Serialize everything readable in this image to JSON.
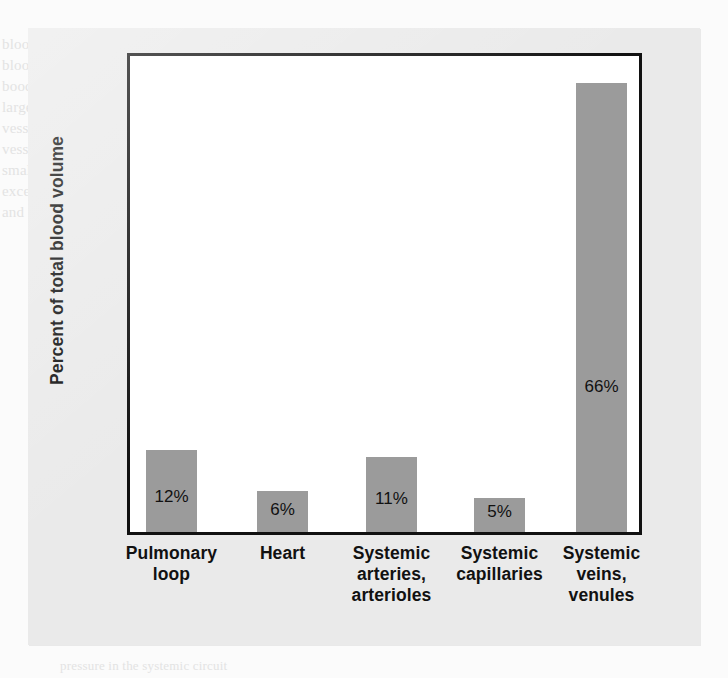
{
  "figure": {
    "background_color": "#eaeaea",
    "plot_background_color": "#ffffff",
    "frame_color": "#111111",
    "bar_color": "#9b9b9b"
  },
  "bleed_text": {
    "left": "blood\nblood v\nbood p\nlarge b\nvessel\nvessel\nsmall b\nexceed\nand re",
    "right": "arteries\nterminal\nno to c\nor cha\nonly tw\n\nas the\nnd the\nhich is\nitates",
    "bottom": "pressure in the systemic circuit"
  },
  "chart_data": {
    "type": "bar",
    "title": "",
    "xlabel": "",
    "ylabel": "Percent of total blood volume",
    "ylim": [
      0,
      70
    ],
    "grid": false,
    "legend": false,
    "categories": [
      "Pulmonary loop",
      "Heart",
      "Systemic arteries, arterioles",
      "Systemic capillaries",
      "Systemic veins, venules"
    ],
    "category_lines": [
      [
        "Pulmonary",
        "loop"
      ],
      [
        "Heart"
      ],
      [
        "Systemic",
        "arteries,",
        "arterioles"
      ],
      [
        "Systemic",
        "capillaries"
      ],
      [
        "Systemic",
        "veins,",
        "venules"
      ]
    ],
    "values": [
      12,
      6,
      11,
      5,
      66
    ],
    "value_labels": [
      "12%",
      "6%",
      "11%",
      "5%",
      "66%"
    ]
  }
}
